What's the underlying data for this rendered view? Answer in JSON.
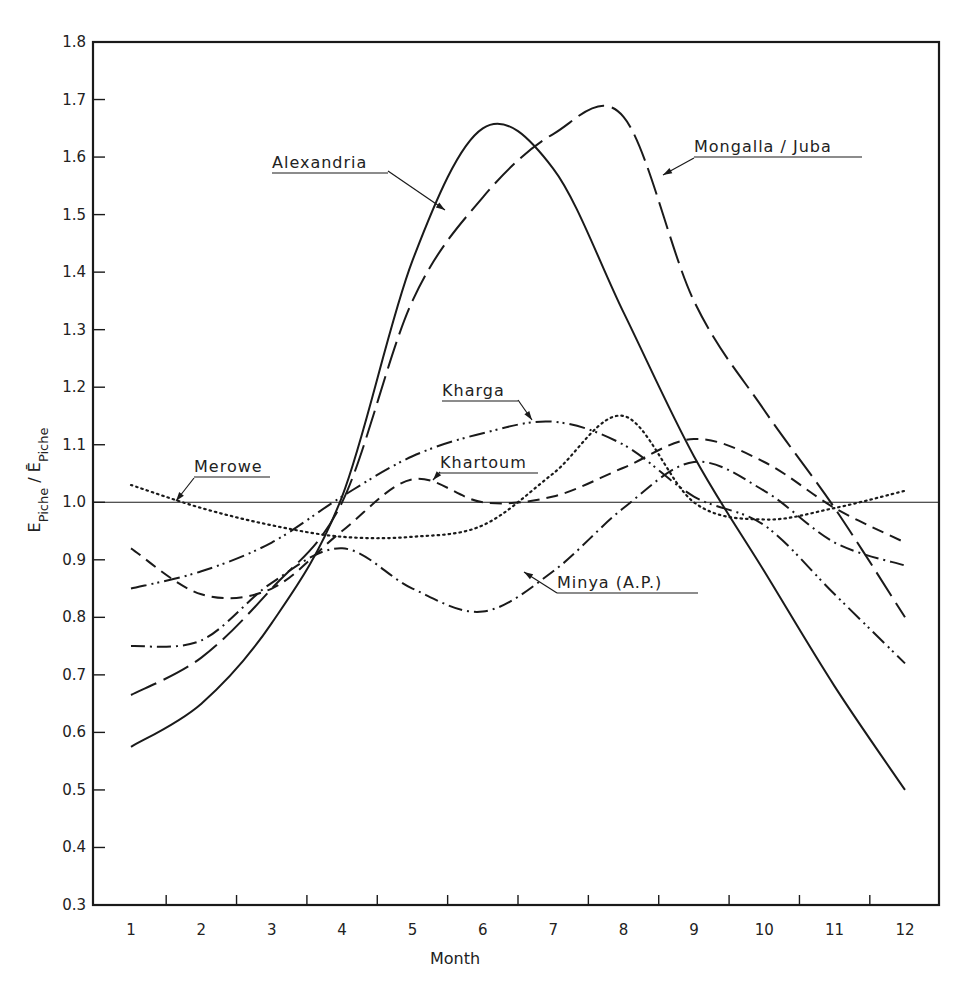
{
  "chart_data": {
    "type": "line",
    "title": "",
    "xlabel": "Month",
    "ylabel": "E_Piche / Ē_Piche",
    "ylabel_parts": {
      "main": "E",
      "sub": "Piche",
      "sep": " / ",
      "main2": "Ē",
      "sub2": "Piche"
    },
    "x": [
      1,
      2,
      3,
      4,
      5,
      6,
      7,
      8,
      9,
      10,
      11,
      12
    ],
    "x_tick_labels": [
      "1",
      "2",
      "3",
      "4",
      "5",
      "6",
      "7",
      "8",
      "9",
      "10",
      "11",
      "12"
    ],
    "y_tick_labels": [
      "0.3",
      "0.4",
      "0.5",
      "0.6",
      "0.7",
      "0.8",
      "0.9",
      "1.0",
      "1.1",
      "1.2",
      "1.3",
      "1.4",
      "1.5",
      "1.6",
      "1.7",
      "1.8"
    ],
    "ylim": [
      0.3,
      1.8
    ],
    "xlim": [
      0.5,
      12.5
    ],
    "grid": false,
    "reference_line": 1.0,
    "legend_position": "inline annotations with leader arrows",
    "series": [
      {
        "name": "Alexandria",
        "style": "solid",
        "values": [
          0.575,
          0.65,
          0.79,
          1.01,
          1.42,
          1.65,
          1.58,
          1.33,
          1.08,
          0.88,
          0.68,
          0.5
        ]
      },
      {
        "name": "Mongalla / Juba",
        "style": "long-dash",
        "values": [
          0.665,
          0.73,
          0.85,
          1.0,
          1.35,
          1.53,
          1.64,
          1.67,
          1.35,
          1.16,
          0.99,
          0.8
        ]
      },
      {
        "name": "Kharga",
        "style": "dash-dot-dot",
        "values": [
          0.85,
          0.88,
          0.93,
          1.01,
          1.08,
          1.12,
          1.14,
          1.1,
          1.01,
          0.96,
          0.84,
          0.72
        ]
      },
      {
        "name": "Khartoum",
        "style": "dash",
        "values": [
          0.92,
          0.84,
          0.85,
          0.95,
          1.04,
          1.0,
          1.01,
          1.06,
          1.11,
          1.07,
          0.99,
          0.93
        ]
      },
      {
        "name": "Merowe",
        "style": "dotted",
        "values": [
          1.03,
          0.99,
          0.96,
          0.94,
          0.94,
          0.96,
          1.05,
          1.15,
          1.0,
          0.97,
          0.99,
          1.02
        ]
      },
      {
        "name": "Minya (A.P.)",
        "style": "dash-dot",
        "values": [
          0.75,
          0.76,
          0.86,
          0.92,
          0.85,
          0.81,
          0.88,
          0.99,
          1.07,
          1.02,
          0.93,
          0.89
        ]
      }
    ],
    "annotations": [
      {
        "label": "Alexandria",
        "series": "Alexandria"
      },
      {
        "label": "Mongalla / Juba",
        "series": "Mongalla / Juba"
      },
      {
        "label": "Kharga",
        "series": "Kharga"
      },
      {
        "label": "Khartoum",
        "series": "Khartoum"
      },
      {
        "label": "Merowe",
        "series": "Merowe"
      },
      {
        "label": "Minya (A.P.)",
        "series": "Minya (A.P.)"
      }
    ]
  },
  "colors": {
    "ink": "#1a1a1a",
    "background": "#ffffff"
  }
}
